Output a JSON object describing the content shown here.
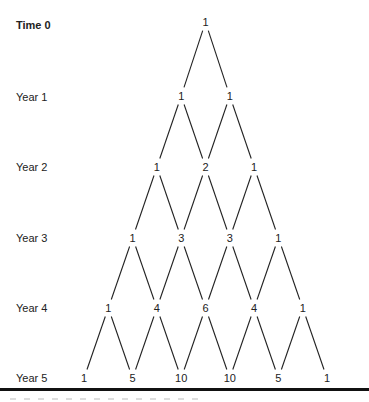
{
  "diagram": {
    "type": "binomial-tree",
    "row_labels": [
      "Time 0",
      "Year 1",
      "Year 2",
      "Year 3",
      "Year 4",
      "Year 5"
    ],
    "rows": [
      [
        1
      ],
      [
        1,
        1
      ],
      [
        1,
        2,
        1
      ],
      [
        1,
        3,
        3,
        1
      ],
      [
        1,
        4,
        6,
        4,
        1
      ],
      [
        1,
        5,
        10,
        10,
        5,
        1
      ]
    ],
    "caption_visible": "cut off / illegible"
  },
  "layout": {
    "center_x": 205.5,
    "half_step": 24.3,
    "row_y": [
      22,
      96,
      167,
      238,
      308,
      378
    ],
    "label_y": [
      25,
      97,
      167,
      238,
      308,
      378
    ],
    "line_color": "#222222",
    "divider_color": "#111111"
  }
}
